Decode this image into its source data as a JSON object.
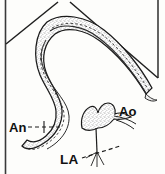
{
  "figure": {
    "type": "anatomical-line-drawing",
    "background_color": "#fdfdfb",
    "ink_color": "#1a1a1a",
    "stipple_color": "#6b6b6b",
    "labels": [
      {
        "id": "an",
        "text": "An",
        "meaning": "aneurysm",
        "leader": "dashed"
      },
      {
        "id": "ao",
        "text": "Ao",
        "meaning": "aorta",
        "leader": "none"
      },
      {
        "id": "la",
        "text": "LA",
        "meaning": "left atrium",
        "leader": "dashed"
      }
    ],
    "frame": {
      "left_border": true,
      "right_border": true,
      "chevron_apex": true
    }
  }
}
